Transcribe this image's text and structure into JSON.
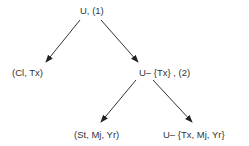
{
  "diagram": {
    "nodes": [
      {
        "id": "root",
        "label": "U, (1)"
      },
      {
        "id": "left1",
        "label": "(Cl, Tx)"
      },
      {
        "id": "right1",
        "label": "U– {Tx} , (2)"
      },
      {
        "id": "left2",
        "label": "(St, Mj, Yr)"
      },
      {
        "id": "right2",
        "label": "U– {Tx, Mj, Yr}"
      }
    ],
    "edges": [
      {
        "from": "root",
        "to": "left1"
      },
      {
        "from": "root",
        "to": "right1"
      },
      {
        "from": "right1",
        "to": "left2"
      },
      {
        "from": "right1",
        "to": "right2"
      }
    ]
  }
}
